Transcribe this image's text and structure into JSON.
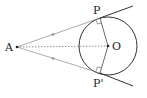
{
  "diagram": {
    "type": "geometry",
    "points": {
      "A": {
        "label": "A",
        "x": 17,
        "y": 47
      },
      "O": {
        "label": "O",
        "x": 108,
        "y": 46
      },
      "P": {
        "label": "P",
        "x": 100,
        "y": 18
      },
      "P_prime": {
        "label": "P'",
        "x": 100,
        "y": 73
      }
    },
    "circle": {
      "center": "O",
      "radius": 29
    },
    "segments": [
      {
        "from": "A",
        "to": "P",
        "style": "solid-thin",
        "tick_mark": true
      },
      {
        "from": "A",
        "to": "P_prime",
        "style": "solid-thin",
        "tick_mark": true
      },
      {
        "from": "A",
        "to": "O",
        "style": "dashed"
      },
      {
        "from": "O",
        "to": "P",
        "style": "solid"
      },
      {
        "from": "O",
        "to": "P_prime",
        "style": "solid"
      }
    ],
    "tangent_extensions": [
      {
        "from": "P",
        "to_x": 133,
        "to_y": 6
      },
      {
        "from": "P_prime",
        "to_x": 133,
        "to_y": 86
      }
    ],
    "right_angles": [
      "P",
      "P_prime"
    ],
    "colors": {
      "line": "#333333",
      "thin_line": "#777777",
      "label": "#222222"
    }
  }
}
